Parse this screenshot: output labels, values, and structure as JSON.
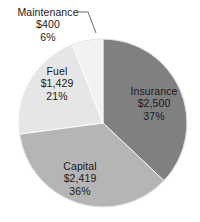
{
  "chart_data": {
    "type": "pie",
    "title": "",
    "subtitle": "",
    "xlabel": "",
    "ylabel": "",
    "legend_position": "none",
    "grid": false,
    "labels_inside_slices": true,
    "categories": [
      "Insurance",
      "Capital",
      "Fuel",
      "Maintenance"
    ],
    "values": [
      2500,
      2419,
      1429,
      400
    ],
    "percentages": [
      37,
      36,
      21,
      6
    ],
    "value_labels": [
      "$2,500",
      "$2,419",
      "$1,429",
      "$400"
    ],
    "percent_labels": [
      "37%",
      "36%",
      "21%",
      "6%"
    ],
    "colors": [
      "#808080",
      "#b5b5b5",
      "#e6e6e6",
      "#f2f2f2"
    ],
    "start_angle_deg": 0,
    "direction": "clockwise",
    "slices": [
      {
        "name": "Insurance",
        "value": 2500,
        "value_label": "$2,500",
        "percent": 37,
        "percent_label": "37%",
        "color": "#808080",
        "label_placement": "inside"
      },
      {
        "name": "Capital",
        "value": 2419,
        "value_label": "$2,419",
        "percent": 36,
        "percent_label": "36%",
        "color": "#b5b5b5",
        "label_placement": "inside"
      },
      {
        "name": "Fuel",
        "value": 1429,
        "value_label": "$1,429",
        "percent": 21,
        "percent_label": "21%",
        "color": "#e6e6e6",
        "label_placement": "inside"
      },
      {
        "name": "Maintenance",
        "value": 400,
        "value_label": "$400",
        "percent": 6,
        "percent_label": "6%",
        "color": "#f2f2f2",
        "label_placement": "outside-with-leader-line"
      }
    ]
  }
}
